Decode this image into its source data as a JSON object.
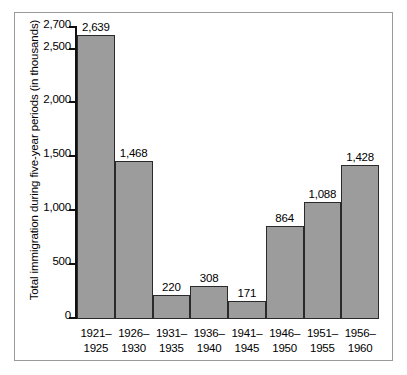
{
  "chart_data": {
    "type": "bar",
    "title": "",
    "subtitle": "",
    "xlabel": "",
    "ylabel": "Total immigration during five-year periods (in thousands)",
    "categories": [
      "1921– 1925",
      "1926– 1930",
      "1931– 1935",
      "1936– 1940",
      "1941– 1945",
      "1946– 1950",
      "1951– 1955",
      "1956– 1960"
    ],
    "category_lines": [
      [
        "1921–",
        "1925"
      ],
      [
        "1926–",
        "1930"
      ],
      [
        "1931–",
        "1935"
      ],
      [
        "1936–",
        "1940"
      ],
      [
        "1941–",
        "1945"
      ],
      [
        "1946–",
        "1950"
      ],
      [
        "1951–",
        "1955"
      ],
      [
        "1956–",
        "1960"
      ]
    ],
    "values": [
      2639,
      1468,
      220,
      308,
      171,
      864,
      1088,
      1428
    ],
    "value_labels": [
      "2,639",
      "1,468",
      "220",
      "308",
      "171",
      "864",
      "1,088",
      "1,428"
    ],
    "ylim": [
      0,
      2700
    ],
    "yticks": [
      0,
      500,
      1000,
      1500,
      2000,
      2500,
      2700
    ],
    "ytick_labels": [
      "0",
      "500",
      "1,000",
      "1,500",
      "2,000",
      "2,500",
      "2,700"
    ],
    "grid": false,
    "legend": null,
    "legend_position": "none",
    "bar_color": "#9c9c9c",
    "bar_edge_color": "#2a2a2a",
    "axis_color": "#111111",
    "frame_color": "#9a9a9a",
    "background": "#ffffff",
    "bars_touching": true
  }
}
